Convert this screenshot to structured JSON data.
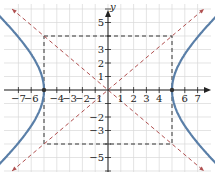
{
  "graph": {
    "y_axis_label": "y",
    "x_ticks": [
      {
        "v": -7,
        "label": "−7"
      },
      {
        "v": -6,
        "label": "−6"
      },
      {
        "v": -4,
        "label": "−4"
      },
      {
        "v": -3,
        "label": "−3"
      },
      {
        "v": -2,
        "label": "−2"
      },
      {
        "v": -1,
        "label": "−1"
      },
      {
        "v": 1,
        "label": "1"
      },
      {
        "v": 2,
        "label": "2"
      },
      {
        "v": 3,
        "label": "3"
      },
      {
        "v": 4,
        "label": "4"
      },
      {
        "v": 6,
        "label": "6"
      },
      {
        "v": 7,
        "label": "7"
      }
    ],
    "y_ticks": [
      {
        "v": 5,
        "label": "5"
      },
      {
        "v": 3,
        "label": "3"
      },
      {
        "v": 2,
        "label": "2"
      },
      {
        "v": 1,
        "label": "1"
      },
      {
        "v": -2,
        "label": "−2"
      },
      {
        "v": -3,
        "label": "−3"
      },
      {
        "v": -5,
        "label": "−5"
      }
    ],
    "colors": {
      "hyperbola": "#5a7fa8",
      "asymptote": "#b05050",
      "box": "#333333",
      "grid": "#d8d8d8"
    },
    "hyperbola": {
      "a": 5,
      "b": 4,
      "equation": "x^2/25 - y^2/16 = 1"
    },
    "vertices": [
      [
        -5,
        0
      ],
      [
        5,
        0
      ]
    ]
  }
}
